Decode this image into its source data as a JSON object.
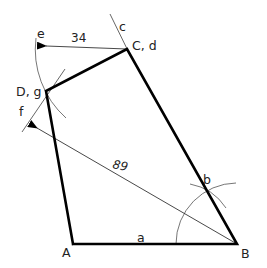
{
  "diagram": {
    "type": "geometric-construction-quadrilateral",
    "points": {
      "A": {
        "label": "A",
        "x": 73,
        "y": 244
      },
      "B": {
        "label": "B",
        "x": 237,
        "y": 244
      },
      "C": {
        "label": "C, d",
        "x": 127,
        "y": 49
      },
      "D": {
        "label": "D, g",
        "x": 46,
        "y": 91
      }
    },
    "construction_labels": {
      "a": "a",
      "b": "b",
      "c": "c",
      "e": "e",
      "f": "f"
    },
    "dimensions": {
      "ce_length": "34",
      "bf_length": "89"
    },
    "colors": {
      "outline": "#000000",
      "construction": "#666666",
      "background": "#ffffff"
    }
  }
}
